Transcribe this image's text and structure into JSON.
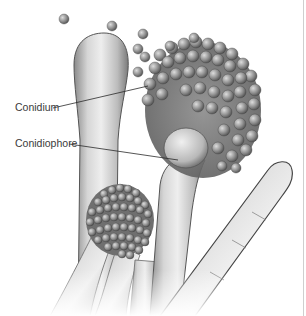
{
  "figure": {
    "labels": [
      {
        "id": "conidium",
        "text": "Conidium",
        "x": 15,
        "y": 104,
        "line_from": [
          53,
          108
        ],
        "line_to": [
          148,
          86
        ]
      },
      {
        "id": "conidiophore",
        "text": "Conidiophore",
        "x": 15,
        "y": 140,
        "line_from": [
          69,
          144
        ],
        "line_to": [
          178,
          160
        ]
      }
    ],
    "colors": {
      "background": "#ffffff",
      "hypha_light": "#e4e4e4",
      "hypha_mid": "#b5b5b5",
      "hypha_dark": "#6a6a6a",
      "spore": "#8f8f8f",
      "leader_line": "#2a2a2a"
    }
  }
}
